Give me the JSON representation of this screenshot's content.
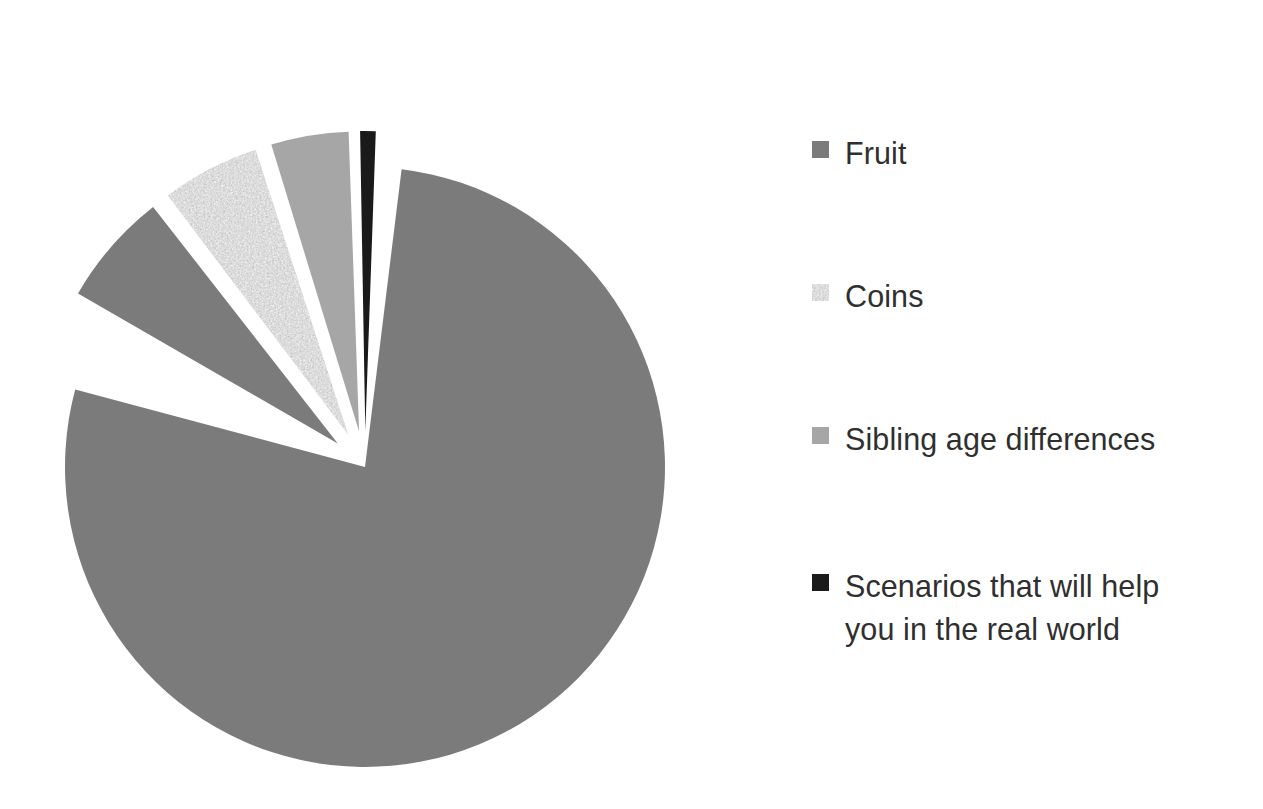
{
  "chart_data": {
    "type": "pie",
    "title": "",
    "subtitle": "",
    "legend_position": "right",
    "grid": false,
    "exploded": true,
    "total": 100,
    "categories": [
      "Fruit",
      "Coins",
      "Sibling age differences",
      "Scenarios that will help you in the real world"
    ],
    "values": [
      94,
      2.8,
      2,
      0.5
    ],
    "slices": [
      {
        "label": "Fruit",
        "value": 94,
        "percent": "94%",
        "color": "#7b7b7b",
        "fill": "solid",
        "exploded": false,
        "start_angle_deg": 7,
        "sweep_deg": 278
      },
      {
        "label": "Fruit (exploded wedge)",
        "value": 6,
        "percent": "6%",
        "color": "#7b7b7b",
        "fill": "solid",
        "exploded": true,
        "start_angle_deg": 300,
        "sweep_deg": 22
      },
      {
        "label": "Coins",
        "value": 2.8,
        "percent": "2.8%",
        "color": "#b9b9b9",
        "fill": "noise-texture",
        "exploded": true,
        "start_angle_deg": 323,
        "sweep_deg": 19
      },
      {
        "label": "Sibling age differences",
        "value": 2,
        "percent": "2%",
        "color": "#a6a6a6",
        "fill": "solid",
        "exploded": true,
        "start_angle_deg": 343,
        "sweep_deg": 15
      },
      {
        "label": "Scenarios that will help you in the real world",
        "value": 0.5,
        "percent": "0.5%",
        "color": "#1a1a1a",
        "fill": "solid",
        "exploded": true,
        "start_angle_deg": 359,
        "sweep_deg": 3
      }
    ],
    "legend": [
      {
        "label": "Fruit",
        "color": "#7b7b7b",
        "fill": "solid"
      },
      {
        "label": "Coins",
        "color": "#b9b9b9",
        "fill": "noise-texture"
      },
      {
        "label": "Sibling age differences",
        "color": "#a6a6a6",
        "fill": "solid"
      },
      {
        "label": "Scenarios that will help\nyou in the real world",
        "color": "#1a1a1a",
        "fill": "solid"
      }
    ]
  },
  "colors": {
    "background": "#ffffff",
    "fruit_gray": "#7b7b7b",
    "coins_texture_base": "#b9b9b9",
    "sibling_gray": "#a6a6a6",
    "scenarios_black": "#1a1a1a",
    "text": "#2f2f2f"
  }
}
